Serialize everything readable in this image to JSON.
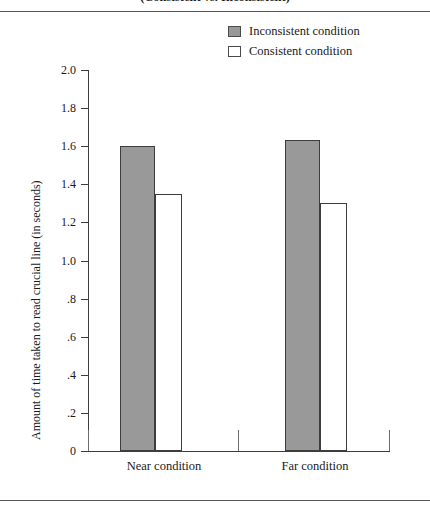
{
  "figure": {
    "clipped_title": "(Consistent vs. Inconsistent)",
    "has_top_rule": true,
    "has_bottom_rule": true
  },
  "legend": {
    "position": "top-right",
    "items": [
      {
        "label": "Inconsistent condition",
        "swatch": "filled",
        "color": "#999999"
      },
      {
        "label": "Consistent condition",
        "swatch": "empty",
        "color": "#ffffff"
      }
    ]
  },
  "axes": {
    "y_title": "Amount of time taken to read crucial line (in seconds)",
    "y_ticks": [
      "2.0",
      "1.8",
      "1.6",
      "1.4",
      "1.2",
      "1.0",
      ".8",
      ".6",
      ".4",
      ".2",
      "0"
    ],
    "x_categories": [
      "Near condition",
      "Far condition"
    ]
  },
  "chart_data": {
    "type": "bar",
    "title": "(Consistent vs. Inconsistent)",
    "xlabel": "",
    "ylabel": "Amount of time taken to read crucial line (in seconds)",
    "categories": [
      "Near condition",
      "Far condition"
    ],
    "series": [
      {
        "name": "Inconsistent condition",
        "values": [
          1.6,
          1.63
        ],
        "color": "#999999"
      },
      {
        "name": "Consistent condition",
        "values": [
          1.35,
          1.3
        ],
        "color": "#ffffff"
      }
    ],
    "ylim": [
      0,
      2.0
    ],
    "ytick_values": [
      2.0,
      1.8,
      1.6,
      1.4,
      1.2,
      1.0,
      0.8,
      0.6,
      0.4,
      0.2,
      0
    ],
    "ytick_labels": [
      "2.0",
      "1.8",
      "1.6",
      "1.4",
      "1.2",
      "1.0",
      ".8",
      ".6",
      ".4",
      ".2",
      "0"
    ],
    "grid": false,
    "legend_position": "top-right"
  }
}
